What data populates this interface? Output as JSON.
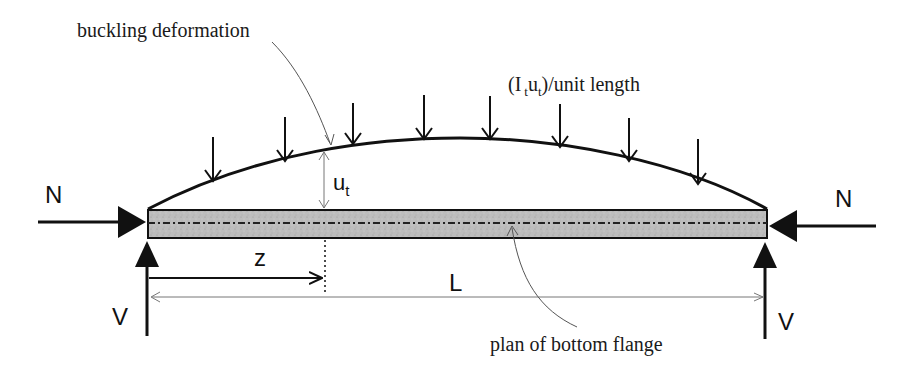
{
  "diagram": {
    "labels": {
      "buckling_deformation": "buckling deformation",
      "restraint_load_prefix": "(I",
      "restraint_load_sub1": "t",
      "restraint_load_mid": "u",
      "restraint_load_sub2": "t",
      "restraint_load_suffix": ")/unit length",
      "u_main": "u",
      "u_sub": "t",
      "axial_left": "N",
      "axial_right": "N",
      "reaction_left": "V",
      "reaction_right": "V",
      "position": "z",
      "span": "L",
      "plan_of_bottom_flange": "plan of bottom flange"
    },
    "load_arrows_count": 8,
    "colors": {
      "line": "#111111",
      "flange_fill": "#b9b9b9",
      "leader": "#555555",
      "dimension": "#777777"
    }
  }
}
